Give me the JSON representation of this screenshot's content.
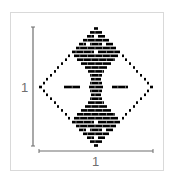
{
  "figure": {
    "frame_color": "#d9d9d9",
    "ink_color": "#000000",
    "axis_color": "#6f6f6f"
  },
  "axes": {
    "vertical": {
      "x": 33,
      "y0": 27,
      "y1": 146,
      "label": "1"
    },
    "horizontal": {
      "y": 151,
      "x0": 39,
      "x1": 153,
      "label": "1"
    }
  },
  "pattern": {
    "row_height": 2.6,
    "rows": [
      {
        "y": 28.5,
        "segments": [
          [
            94,
            98
          ]
        ]
      },
      {
        "y": 32.4,
        "segments": [
          [
            90,
            102
          ]
        ]
      },
      {
        "y": 36.3,
        "segments": [
          [
            87,
            94
          ],
          [
            98,
            105
          ]
        ]
      },
      {
        "y": 40.2,
        "segments": [
          [
            83,
            109
          ]
        ]
      },
      {
        "y": 44.1,
        "segments": [
          [
            79,
            86
          ],
          [
            90,
            102
          ],
          [
            106,
            113
          ]
        ]
      },
      {
        "y": 48.0,
        "segments": [
          [
            76,
            116
          ]
        ]
      },
      {
        "y": 51.9,
        "segments": [
          [
            72,
            94
          ],
          [
            98,
            120
          ]
        ]
      },
      {
        "y": 55.8,
        "segments": [
          [
            68,
            70
          ],
          [
            74,
            118
          ],
          [
            122,
            124
          ]
        ]
      },
      {
        "y": 59.7,
        "segments": [
          [
            65,
            67
          ],
          [
            77,
            115
          ],
          [
            125,
            127
          ]
        ]
      },
      {
        "y": 63.6,
        "segments": [
          [
            61,
            63
          ],
          [
            81,
            111
          ],
          [
            129,
            131
          ]
        ]
      },
      {
        "y": 67.5,
        "segments": [
          [
            57,
            59
          ],
          [
            85,
            107
          ],
          [
            133,
            135
          ]
        ]
      },
      {
        "y": 71.4,
        "segments": [
          [
            54,
            56
          ],
          [
            88,
            104
          ],
          [
            136,
            138
          ]
        ]
      },
      {
        "y": 75.3,
        "segments": [
          [
            50,
            52
          ],
          [
            90,
            102
          ],
          [
            140,
            142
          ]
        ]
      },
      {
        "y": 79.2,
        "segments": [
          [
            46,
            48
          ],
          [
            91,
            101
          ],
          [
            144,
            146
          ]
        ]
      },
      {
        "y": 83.1,
        "segments": [
          [
            43,
            45
          ],
          [
            90,
            102
          ],
          [
            147,
            149
          ]
        ]
      },
      {
        "y": 87.0,
        "segments": [
          [
            39,
            42
          ],
          [
            64,
            80
          ],
          [
            89,
            103
          ],
          [
            112,
            128
          ],
          [
            150,
            153
          ]
        ]
      },
      {
        "y": 90.9,
        "segments": [
          [
            43,
            45
          ],
          [
            90,
            102
          ],
          [
            147,
            149
          ]
        ]
      },
      {
        "y": 94.8,
        "segments": [
          [
            46,
            48
          ],
          [
            91,
            101
          ],
          [
            144,
            146
          ]
        ]
      },
      {
        "y": 98.7,
        "segments": [
          [
            50,
            52
          ],
          [
            90,
            102
          ],
          [
            140,
            142
          ]
        ]
      },
      {
        "y": 102.6,
        "segments": [
          [
            54,
            56
          ],
          [
            88,
            104
          ],
          [
            136,
            138
          ]
        ]
      },
      {
        "y": 106.5,
        "segments": [
          [
            57,
            59
          ],
          [
            85,
            107
          ],
          [
            133,
            135
          ]
        ]
      },
      {
        "y": 110.4,
        "segments": [
          [
            61,
            63
          ],
          [
            81,
            111
          ],
          [
            129,
            131
          ]
        ]
      },
      {
        "y": 114.3,
        "segments": [
          [
            65,
            67
          ],
          [
            77,
            115
          ],
          [
            125,
            127
          ]
        ]
      },
      {
        "y": 118.2,
        "segments": [
          [
            68,
            70
          ],
          [
            74,
            118
          ],
          [
            122,
            124
          ]
        ]
      },
      {
        "y": 122.1,
        "segments": [
          [
            72,
            94
          ],
          [
            98,
            120
          ]
        ]
      },
      {
        "y": 126.0,
        "segments": [
          [
            76,
            116
          ]
        ]
      },
      {
        "y": 129.9,
        "segments": [
          [
            79,
            86
          ],
          [
            90,
            102
          ],
          [
            106,
            113
          ]
        ]
      },
      {
        "y": 133.8,
        "segments": [
          [
            83,
            109
          ]
        ]
      },
      {
        "y": 137.7,
        "segments": [
          [
            87,
            94
          ],
          [
            98,
            105
          ]
        ]
      },
      {
        "y": 141.6,
        "segments": [
          [
            90,
            102
          ]
        ]
      },
      {
        "y": 145.5,
        "segments": [
          [
            94,
            98
          ]
        ]
      }
    ],
    "brick_width": 7.6
  }
}
